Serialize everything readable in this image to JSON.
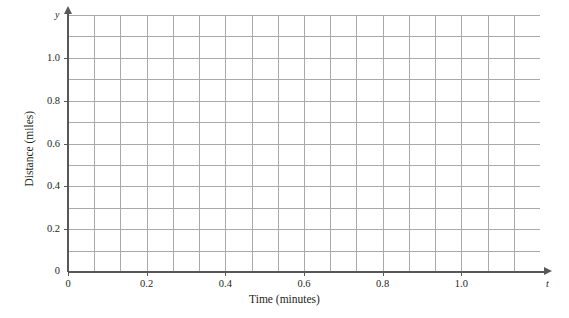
{
  "figure": {
    "kind": "blank-coordinate-grid",
    "background_color": "#ffffff"
  },
  "chart_data": {
    "type": "line",
    "title": "",
    "xlabel": "Time (minutes)",
    "ylabel": "Distance (miles)",
    "x_axis_variable": "t",
    "y_axis_variable": "y",
    "xlim": [
      0,
      1.2
    ],
    "ylim": [
      0,
      1.2
    ],
    "x_ticks": [
      0,
      0.2,
      0.4,
      0.6,
      0.8,
      1.0
    ],
    "x_tick_labels": [
      "0",
      "0.2",
      "0.4",
      "0.6",
      "0.8",
      "1.0"
    ],
    "y_ticks": [
      0,
      0.2,
      0.4,
      0.6,
      0.8,
      1.0
    ],
    "y_tick_labels": [
      "0",
      "0.2",
      "0.4",
      "0.6",
      "0.8",
      "1.0"
    ],
    "grid": true,
    "grid_color": "#a7a9ac",
    "grid_minor_spacing_x": 0.0667,
    "grid_minor_spacing_y": 0.1,
    "grid_columns": 18,
    "grid_rows": 12,
    "legend": null,
    "series": [],
    "values": [],
    "categories": [],
    "annotations": [],
    "axis_color": "#58585b"
  },
  "labels": {
    "x_title": "Time (minutes)",
    "y_title": "Distance (miles)",
    "x_var": "t",
    "y_var": "y",
    "x_ticks": [
      "0",
      "0.2",
      "0.4",
      "0.6",
      "0.8",
      "1.0"
    ],
    "y_ticks": [
      "0",
      "0.2",
      "0.4",
      "0.6",
      "0.8",
      "1.0"
    ]
  }
}
